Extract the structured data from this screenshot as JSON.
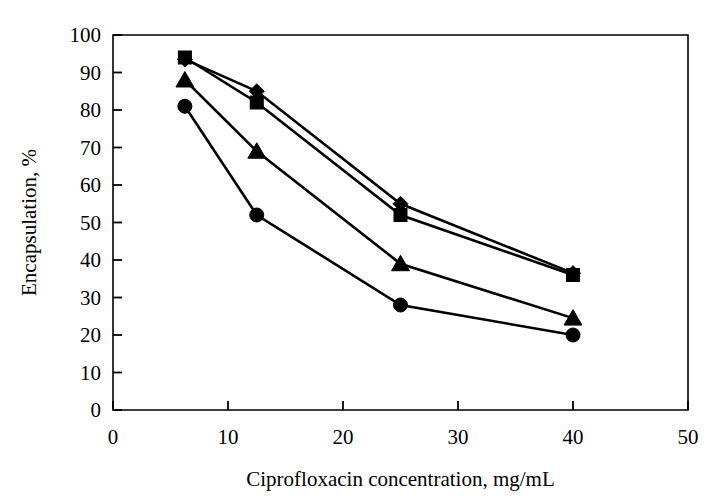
{
  "chart_data": {
    "type": "line",
    "title": "",
    "subtitle": "",
    "xlabel": "Ciprofloxacin concentration, mg/mL",
    "ylabel": "Encapsulation, %",
    "xlim": [
      0,
      50
    ],
    "ylim": [
      0,
      100
    ],
    "xticks": [
      0,
      10,
      20,
      30,
      40,
      50
    ],
    "yticks": [
      0,
      10,
      20,
      30,
      40,
      50,
      60,
      70,
      80,
      90,
      100
    ],
    "xtick_labels": [
      "0",
      "10",
      "20",
      "30",
      "40",
      "50"
    ],
    "ytick_labels": [
      "0",
      "10",
      "20",
      "30",
      "40",
      "50",
      "60",
      "70",
      "80",
      "90",
      "100"
    ],
    "grid": false,
    "legend": null,
    "legend_position": "none",
    "x": [
      6.25,
      12.5,
      25,
      40
    ],
    "series": [
      {
        "name": "series-square",
        "marker": "square",
        "color": "#000000",
        "values": [
          94,
          82,
          52,
          36
        ]
      },
      {
        "name": "series-diamond",
        "marker": "diamond",
        "color": "#000000",
        "values": [
          93.5,
          85,
          55,
          36.5
        ]
      },
      {
        "name": "series-triangle",
        "marker": "triangle",
        "color": "#000000",
        "values": [
          88,
          69,
          39,
          24.5
        ]
      },
      {
        "name": "series-circle",
        "marker": "circle",
        "color": "#000000",
        "values": [
          81,
          52,
          28,
          20
        ]
      }
    ],
    "annotations": []
  },
  "figure": {
    "background_color": "#ffffff",
    "line_color": "#000000"
  }
}
